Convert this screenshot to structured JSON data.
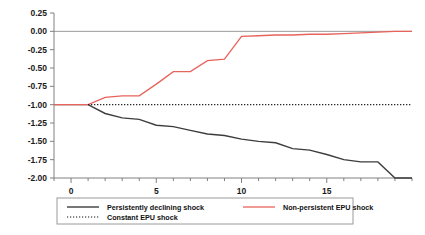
{
  "chart_data": {
    "type": "line",
    "title": "",
    "xlabel": "",
    "ylabel": "",
    "xlim": [
      -1,
      20
    ],
    "ylim": [
      -2.0,
      0.25
    ],
    "ytick_labels": [
      "0.25",
      "0.00",
      "-0.25",
      "-0.50",
      "-0.75",
      "-1.00",
      "-1.25",
      "-1.50",
      "-1.75",
      "-2.00"
    ],
    "ytick_values": [
      0.25,
      0.0,
      -0.25,
      -0.5,
      -0.75,
      -1.0,
      -1.25,
      -1.5,
      -1.75,
      -2.0
    ],
    "xtick_labels": [
      "0",
      "5",
      "10",
      "15"
    ],
    "xtick_values": [
      0,
      5,
      10,
      15
    ],
    "xminor_step": 1,
    "grid": false,
    "legend_position": "below-center",
    "series": [
      {
        "name": "Persistently declining shock",
        "color": "#3d3d3d",
        "style": "solid",
        "x": [
          -1,
          0,
          1,
          2,
          3,
          4,
          5,
          6,
          7,
          8,
          9,
          10,
          11,
          12,
          13,
          14,
          15,
          16,
          17,
          18,
          19,
          20
        ],
        "values": [
          -1.0,
          -1.0,
          -1.0,
          -1.12,
          -1.18,
          -1.2,
          -1.28,
          -1.3,
          -1.35,
          -1.4,
          -1.42,
          -1.47,
          -1.5,
          -1.52,
          -1.6,
          -1.62,
          -1.68,
          -1.75,
          -1.78,
          -1.78,
          -2.0,
          -2.0
        ]
      },
      {
        "name": "Non-persistent EPU  shock",
        "color": "#e8635c",
        "style": "solid",
        "x": [
          -1,
          0,
          1,
          2,
          3,
          4,
          5,
          6,
          7,
          8,
          9,
          10,
          11,
          12,
          13,
          14,
          15,
          16,
          17,
          18,
          19,
          20
        ],
        "values": [
          -1.0,
          -1.0,
          -1.0,
          -0.9,
          -0.88,
          -0.88,
          -0.72,
          -0.55,
          -0.55,
          -0.4,
          -0.38,
          -0.07,
          -0.06,
          -0.05,
          -0.05,
          -0.04,
          -0.04,
          -0.03,
          -0.02,
          -0.01,
          0.0,
          0.0
        ]
      },
      {
        "name": "Constant EPU  shock",
        "color": "#111111",
        "style": "dotted",
        "x": [
          1,
          20
        ],
        "values": [
          -1.0,
          -1.0
        ]
      }
    ]
  },
  "legend": {
    "entries": [
      {
        "label": "Persistently declining shock",
        "style": "solid-black"
      },
      {
        "label": "Non-persistent EPU  shock",
        "style": "solid-red"
      },
      {
        "label": "Constant EPU  shock",
        "style": "dotted-black"
      }
    ]
  }
}
